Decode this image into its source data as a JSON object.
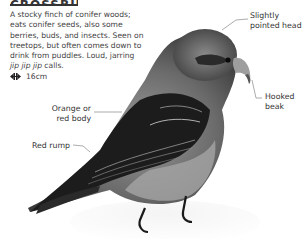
{
  "title": "CROSSBILL",
  "description": {
    "text": "A stocky finch of conifer woods; eats conifer seeds, also some berries, buds, and insects. Seen on treetops, but often comes down to drink from puddles. Loud, jarring",
    "call_italic": "jip jip jip",
    "call_suffix": " calls."
  },
  "size": {
    "icon": "wingspan-arrows-icon",
    "value": "16cm"
  },
  "labels": {
    "head": [
      "Slightly",
      "pointed head"
    ],
    "beak": [
      "Hooked",
      "beak"
    ],
    "body": [
      "Orange or",
      "red body"
    ],
    "rump": "Red rump"
  },
  "colors": {
    "text": "#444444",
    "leader_line": "#888888",
    "bird_dark": "#1a1a1a",
    "bird_mid": "#6e6e6e",
    "bird_light": "#bdbdbd",
    "snow": "#f2f2f2"
  }
}
